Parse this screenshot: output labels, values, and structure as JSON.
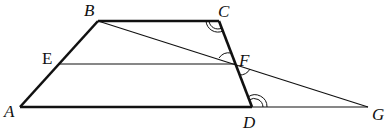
{
  "diagram": {
    "type": "geometry",
    "points": {
      "A": {
        "label": "A",
        "x": 20,
        "y": 107
      },
      "B": {
        "label": "B",
        "x": 98,
        "y": 21
      },
      "C": {
        "label": "C",
        "x": 219,
        "y": 21
      },
      "D": {
        "label": "D",
        "x": 252,
        "y": 107
      },
      "E": {
        "label": "E",
        "x": 59,
        "y": 64
      },
      "F": {
        "label": "F",
        "x": 235,
        "y": 64
      },
      "G": {
        "label": "G",
        "x": 368,
        "y": 107
      }
    },
    "segments": [
      "AB",
      "BC",
      "CD",
      "AD",
      "EF",
      "BG",
      "DG"
    ],
    "angle_marks": [
      {
        "at": "C",
        "type": "double-arc"
      },
      {
        "at": "D",
        "type": "double-arc"
      },
      {
        "at": "F",
        "type": "single-arc",
        "position": "upper-left"
      },
      {
        "at": "F",
        "type": "single-arc",
        "position": "lower-right"
      }
    ]
  }
}
